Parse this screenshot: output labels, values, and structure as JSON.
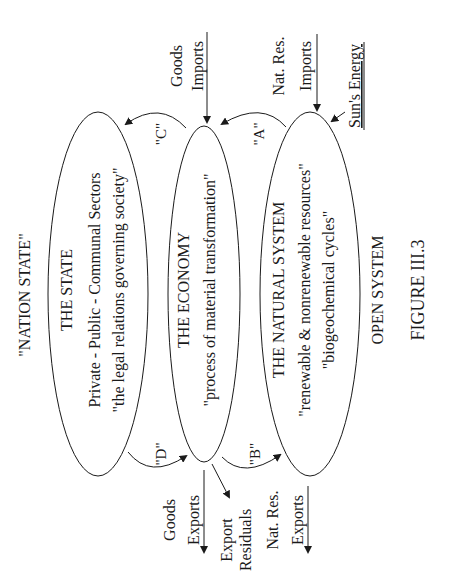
{
  "figure": {
    "title": "\"NATION STATE\"",
    "caption": "FIGURE III.3",
    "system_label": "OPEN SYSTEM"
  },
  "ellipses": {
    "state": {
      "title": "THE STATE",
      "line1": "Private - Public - Communal Sectors",
      "line2": "\"the legal relations governing society\""
    },
    "economy": {
      "title": "THE ECONOMY",
      "line1": "\"process of material transformation\""
    },
    "natural": {
      "title": "THE NATURAL SYSTEM",
      "line1": "\"renewable & nonrenewable resources\"",
      "line2": "\"biogeochemical cycles\""
    }
  },
  "flows": {
    "A": "\"A\"",
    "B": "\"B\"",
    "C": "\"C\"",
    "D": "\"D\""
  },
  "inputs": {
    "goods_imports": [
      "Goods",
      "Imports"
    ],
    "natres_imports": [
      "Nat. Res.",
      "Imports"
    ],
    "sun": "Sun's Energy"
  },
  "outputs": {
    "goods_exports": [
      "Goods",
      "Exports"
    ],
    "export_residuals": [
      "Export",
      "Residuals"
    ],
    "natres_exports": [
      "Nat. Res.",
      "Exports"
    ]
  },
  "colors": {
    "ink": "#1a1a1a",
    "background": "#ffffff"
  }
}
